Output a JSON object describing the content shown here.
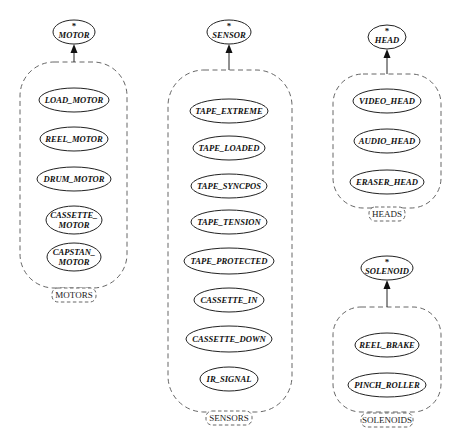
{
  "diagram": {
    "groups": [
      {
        "id": "motors",
        "parent": {
          "label": "MOTOR",
          "marker": "*",
          "cx": 74,
          "cy": 32,
          "rx": 21,
          "ry": 12
        },
        "box": {
          "x": 20,
          "y": 62,
          "w": 107,
          "h": 226,
          "r": 34
        },
        "tag": {
          "label": "MOTORS",
          "cx": 74,
          "cy": 295,
          "w": 44,
          "h": 14
        },
        "children": [
          {
            "lines": [
              "LOAD_MOTOR"
            ],
            "cx": 74,
            "cy": 100,
            "rx": 35,
            "ry": 12
          },
          {
            "lines": [
              "REEL_MOTOR"
            ],
            "cx": 74,
            "cy": 139,
            "rx": 34,
            "ry": 12
          },
          {
            "lines": [
              "DRUM_MOTOR"
            ],
            "cx": 74,
            "cy": 179,
            "rx": 37,
            "ry": 12
          },
          {
            "lines": [
              "CASSETTE_",
              "MOTOR"
            ],
            "cx": 74,
            "cy": 220,
            "rx": 28,
            "ry": 14
          },
          {
            "lines": [
              "CAPSTAN_",
              "MOTOR"
            ],
            "cx": 74,
            "cy": 257,
            "rx": 27,
            "ry": 14
          }
        ]
      },
      {
        "id": "sensors",
        "parent": {
          "label": "SENSOR",
          "marker": "*",
          "cx": 229,
          "cy": 32,
          "rx": 22,
          "ry": 12
        },
        "box": {
          "x": 168,
          "y": 70,
          "w": 124,
          "h": 342,
          "r": 36
        },
        "tag": {
          "label": "SENSORS",
          "cx": 229,
          "cy": 418,
          "w": 46,
          "h": 14
        },
        "children": [
          {
            "lines": [
              "TAPE_EXTREME"
            ],
            "cx": 229,
            "cy": 111,
            "rx": 39,
            "ry": 12
          },
          {
            "lines": [
              "TAPE_LOADED"
            ],
            "cx": 229,
            "cy": 148,
            "rx": 36,
            "ry": 12
          },
          {
            "lines": [
              "TAPE_SYNCPOS"
            ],
            "cx": 229,
            "cy": 186,
            "rx": 38,
            "ry": 12
          },
          {
            "lines": [
              "TAPE_TENSION"
            ],
            "cx": 229,
            "cy": 222,
            "rx": 38,
            "ry": 12
          },
          {
            "lines": [
              "TAPE_PROTECTED"
            ],
            "cx": 229,
            "cy": 261,
            "rx": 45,
            "ry": 13
          },
          {
            "lines": [
              "CASSETTE_IN"
            ],
            "cx": 229,
            "cy": 300,
            "rx": 35,
            "ry": 12
          },
          {
            "lines": [
              "CASSETTE_DOWN"
            ],
            "cx": 229,
            "cy": 339,
            "rx": 43,
            "ry": 13
          },
          {
            "lines": [
              "IR_SIGNAL"
            ],
            "cx": 229,
            "cy": 379,
            "rx": 29,
            "ry": 12
          }
        ]
      },
      {
        "id": "heads",
        "parent": {
          "label": "HEAD",
          "marker": "*",
          "cx": 387,
          "cy": 37,
          "rx": 19,
          "ry": 12
        },
        "box": {
          "x": 333,
          "y": 74,
          "w": 108,
          "h": 134,
          "r": 30
        },
        "tag": {
          "label": "HEADS",
          "cx": 387,
          "cy": 214,
          "w": 36,
          "h": 14
        },
        "children": [
          {
            "lines": [
              "VIDEO_HEAD"
            ],
            "cx": 387,
            "cy": 101,
            "rx": 34,
            "ry": 12
          },
          {
            "lines": [
              "AUDIO_HEAD"
            ],
            "cx": 387,
            "cy": 141,
            "rx": 33,
            "ry": 12
          },
          {
            "lines": [
              "ERASER_HEAD"
            ],
            "cx": 387,
            "cy": 182,
            "rx": 37,
            "ry": 12
          }
        ]
      },
      {
        "id": "solenoids",
        "parent": {
          "label": "SOLENOID",
          "marker": "*",
          "cx": 387,
          "cy": 268,
          "rx": 26,
          "ry": 12
        },
        "box": {
          "x": 333,
          "y": 307,
          "w": 108,
          "h": 105,
          "r": 28
        },
        "tag": {
          "label": "SOLENOIDS",
          "cx": 387,
          "cy": 420,
          "w": 52,
          "h": 14
        },
        "children": [
          {
            "lines": [
              "REEL_BRAKE"
            ],
            "cx": 387,
            "cy": 345,
            "rx": 32,
            "ry": 12
          },
          {
            "lines": [
              "PINCH_ROLLER"
            ],
            "cx": 387,
            "cy": 385,
            "rx": 39,
            "ry": 12
          }
        ]
      }
    ]
  }
}
